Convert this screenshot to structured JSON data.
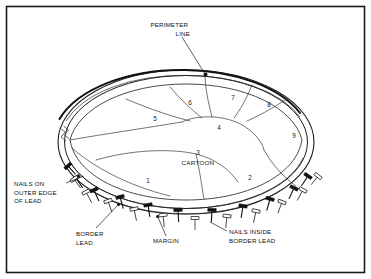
{
  "figure": {
    "background_color": "#ffffff",
    "ink_color": "#111111",
    "frame": {
      "visible": true,
      "stroke_color": "#1b1b1b"
    }
  },
  "callouts": [
    {
      "id": "perimeter-line",
      "lines": [
        "PERIMETER",
        "LINE"
      ],
      "align": "end",
      "x": 190,
      "y": 27
    },
    {
      "id": "nails-on-outer-edge-of-lead",
      "lines": [
        "NAILS ON",
        "OUTER EDGE",
        "OF LEAD"
      ],
      "align": "start",
      "x": 14,
      "y": 186
    },
    {
      "id": "border-lead",
      "lines": [
        "BORDER",
        "LEAD"
      ],
      "align": "start",
      "x": 76,
      "y": 236
    },
    {
      "id": "margin",
      "lines": [
        "MARGIN"
      ],
      "align": "start",
      "x": 153,
      "y": 243
    },
    {
      "id": "nails-inside-border-lead",
      "lines": [
        "NAILS INSIDE",
        "BORDER LEAD"
      ],
      "align": "start",
      "x": 229,
      "y": 234
    }
  ],
  "regions": [
    {
      "id": "region-1",
      "label": "1",
      "x": 148,
      "y": 183
    },
    {
      "id": "region-2",
      "label": "2",
      "x": 250,
      "y": 180
    },
    {
      "id": "region-3",
      "label": "3",
      "x": 198,
      "y": 155
    },
    {
      "id": "region-4",
      "label": "4",
      "x": 219,
      "y": 130
    },
    {
      "id": "region-5",
      "label": "5",
      "x": 155,
      "y": 121
    },
    {
      "id": "region-6",
      "label": "6",
      "x": 190,
      "y": 105
    },
    {
      "id": "region-7",
      "label": "7",
      "x": 233,
      "y": 100
    },
    {
      "id": "region-8",
      "label": "8",
      "x": 269,
      "y": 107
    },
    {
      "id": "region-9",
      "label": "9",
      "x": 294,
      "y": 138
    }
  ],
  "region_word": {
    "id": "cartoon-label",
    "label": "CARTOON",
    "x": 198,
    "y": 165
  },
  "nails": {
    "outer_edge_style": "dark-filled",
    "inside_border_style": "light-outlined",
    "outer_count": 11,
    "inner_count": 11
  }
}
